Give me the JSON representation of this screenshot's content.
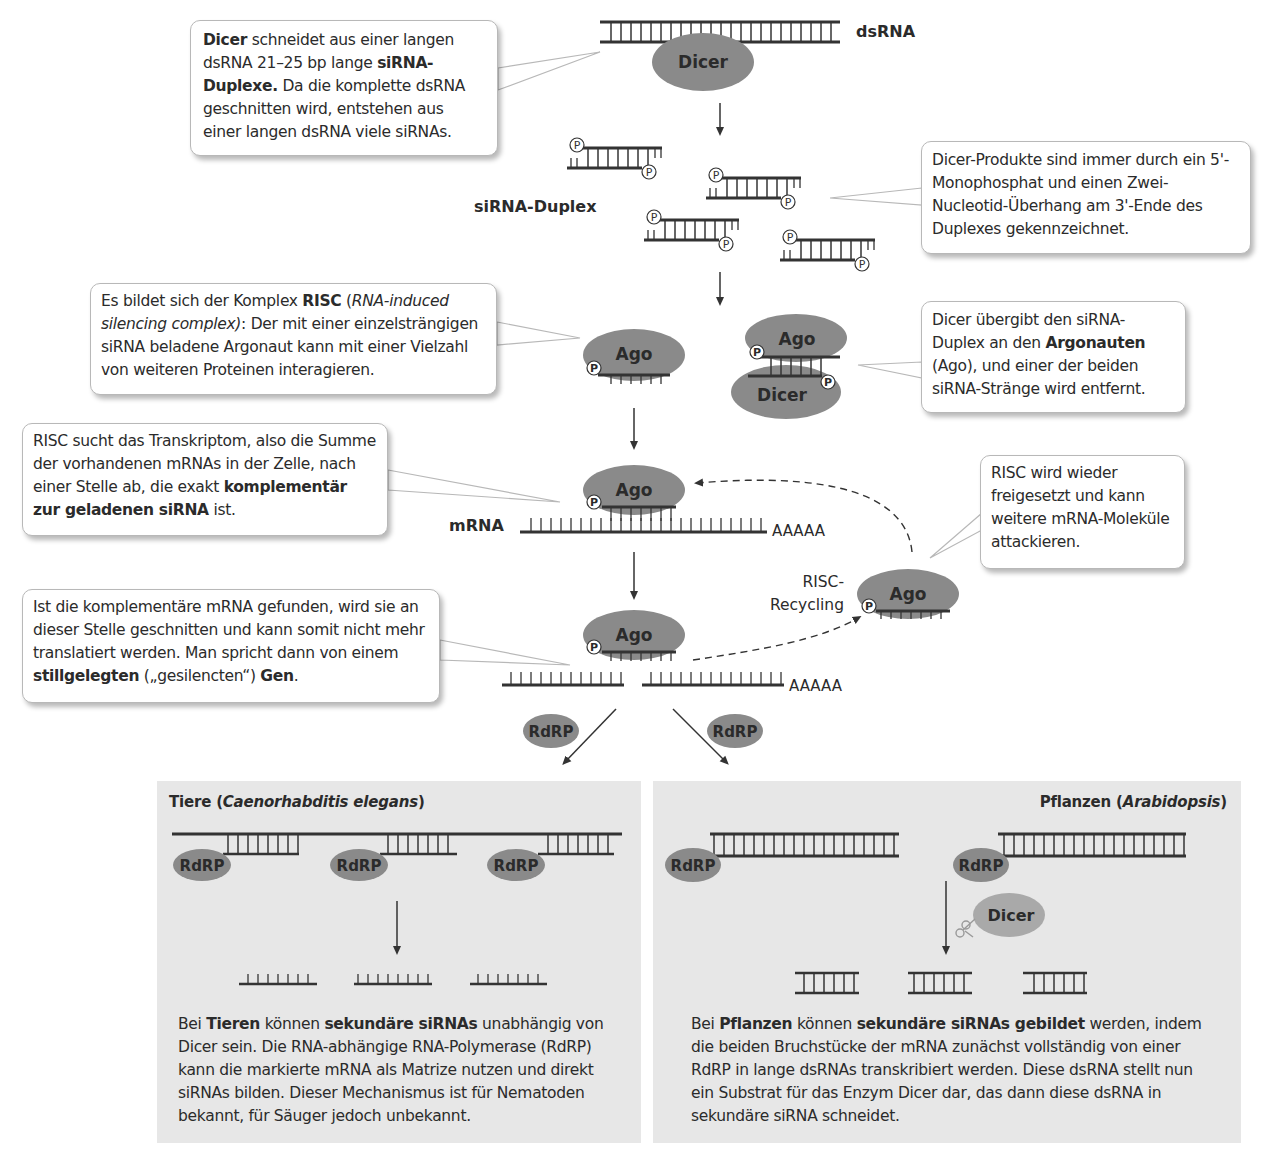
{
  "title_labels": {
    "dsRNA": "dsRNA",
    "siRNA_duplex": "siRNA-Duplex",
    "mRNA": "mRNA",
    "polyA": "AAAAA",
    "risc_recycling_line1": "RISC-",
    "risc_recycling_line2": "Recycling"
  },
  "enzymes": {
    "dicer": "Dicer",
    "ago": "Ago",
    "rdrp": "RdRP",
    "phosphate": "P"
  },
  "callouts": [
    {
      "id": "dicer-cut",
      "segments": [
        {
          "t": "Dicer",
          "b": true
        },
        {
          "t": " schneidet aus einer langen dsRNA 21–25 bp lange ",
          "b": false
        },
        {
          "t": "siRNA-Duplexe.",
          "b": true
        },
        {
          "t": " Da die komplette dsRNA geschnitten wird, entstehen aus einer langen dsRNA viele siRNAs.",
          "b": false
        }
      ]
    },
    {
      "id": "dicer-products",
      "segments": [
        {
          "t": "Dicer-Produkte sind immer durch ein 5'-Monophosphat und einen Zwei-Nucleotid-Überhang am 3'-Ende des Duplexes gekennzeichnet.",
          "b": false
        }
      ]
    },
    {
      "id": "risc-complex",
      "segments": [
        {
          "t": "Es bildet sich der Komplex ",
          "b": false
        },
        {
          "t": "RISC",
          "b": true
        },
        {
          "t": " (",
          "b": false
        },
        {
          "t": "RNA-induced silencing complex)",
          "i": true
        },
        {
          "t": ": Der mit einer einzelsträngigen siRNA beladene Argonaut kann mit einer Vielzahl von weiteren Proteinen interagieren.",
          "b": false
        }
      ]
    },
    {
      "id": "dicer-handover",
      "segments": [
        {
          "t": "Dicer übergibt den siRNA-Duplex an den ",
          "b": false
        },
        {
          "t": "Argonauten",
          "b": true
        },
        {
          "t": " (Ago), und einer der beiden siRNA-Stränge wird entfernt.",
          "b": false
        }
      ]
    },
    {
      "id": "risc-search",
      "segments": [
        {
          "t": "RISC sucht das Transkriptom, also die Summe der vorhandenen mRNAs in der Zelle, nach einer Stelle ab, die exakt ",
          "b": false
        },
        {
          "t": "komplementär zur geladenen siRNA",
          "b": true
        },
        {
          "t": " ist.",
          "b": false
        }
      ]
    },
    {
      "id": "risc-release",
      "segments": [
        {
          "t": "RISC wird wieder freigesetzt und kann weitere mRNA-Moleküle attackieren.",
          "b": false
        }
      ]
    },
    {
      "id": "mrna-cut",
      "segments": [
        {
          "t": "Ist die komplementäre mRNA gefunden, wird sie an dieser Stelle geschnitten und kann somit nicht mehr translatiert werden. Man spricht dann von einem ",
          "b": false
        },
        {
          "t": "stillgelegten",
          "b": true
        },
        {
          "t": " („gesilencten“) ",
          "b": false
        },
        {
          "t": "Gen",
          "b": true
        },
        {
          "t": ".",
          "b": false
        }
      ]
    }
  ],
  "panels": {
    "animals": {
      "title_prefix": "Tiere (",
      "title_italic": "Caenorhabditis elegans",
      "title_suffix": ")",
      "text": [
        {
          "t": "Bei ",
          "b": false
        },
        {
          "t": "Tieren",
          "b": true
        },
        {
          "t": " können ",
          "b": false
        },
        {
          "t": "sekundäre siRNAs",
          "b": true
        },
        {
          "t": " unabhängig von Dicer sein. Die RNA-abhängige RNA-Polymerase (RdRP) kann die markierte mRNA als Matrize nutzen und direkt siRNAs bilden. Dieser Mechanismus ist für Nematoden bekannt, für Säuger jedoch unbekannt.",
          "b": false
        }
      ]
    },
    "plants": {
      "title_prefix": "Pflanzen (",
      "title_italic": "Arabidopsis",
      "title_suffix": ")",
      "text": [
        {
          "t": "Bei ",
          "b": false
        },
        {
          "t": "Pflanzen",
          "b": true
        },
        {
          "t": " können ",
          "b": false
        },
        {
          "t": "sekundäre siRNAs gebildet",
          "b": true
        },
        {
          "t": " werden, indem die beiden Bruchstücke der mRNA zunächst vollständig von einer RdRP in lange dsRNAs transkribiert werden. Diese dsRNA stellt nun ein Substrat für das Enzym Dicer dar, das dann diese dsRNA in sekundäre siRNA schneidet.",
          "b": false
        }
      ]
    }
  },
  "colors": {
    "enzyme_fill": "#8a8a8a",
    "dicer_light": "#a9a9a9",
    "strand": "#333333",
    "panel_bg": "#e7e7e7",
    "callout_border": "#b8b8b8"
  }
}
